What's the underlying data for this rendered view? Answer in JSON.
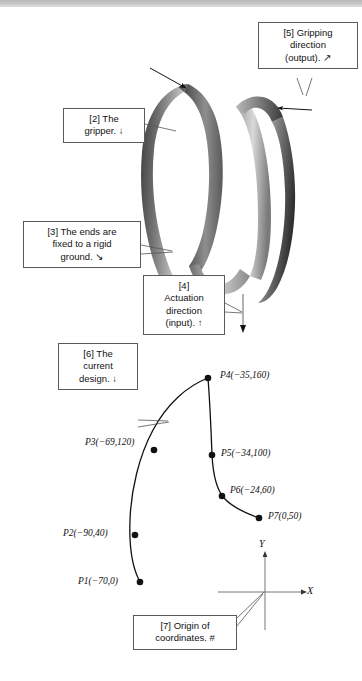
{
  "figure": {
    "topbar_color": "#c4c4c4",
    "background_color": "#ffffff",
    "ribbon_dark": "#3f3f3f",
    "ribbon_light": "#d8d8d8",
    "line_color": "#1a1a1a"
  },
  "callouts": [
    {
      "id": "5",
      "lines": [
        "[5] Gripping",
        "direction",
        "(output).  ↗"
      ],
      "arrow_glyph": "↗"
    },
    {
      "id": "2",
      "lines": [
        "[2] The",
        "gripper.  ↓"
      ],
      "arrow_glyph": "↓"
    },
    {
      "id": "3",
      "lines": [
        "[3] The ends are",
        "fixed to a rigid",
        "ground.  ↘"
      ],
      "arrow_glyph": "↘"
    },
    {
      "id": "4",
      "lines": [
        "[4]",
        "Actuation",
        "direction",
        "(input).  ↑"
      ],
      "arrow_glyph": "↑"
    },
    {
      "id": "6",
      "lines": [
        "[6] The",
        "current",
        "design.  ↓"
      ],
      "arrow_glyph": "↓"
    },
    {
      "id": "7",
      "lines": [
        "[7] Origin of",
        "coordinates.  #"
      ],
      "arrow_glyph": "#"
    }
  ],
  "design_curve": {
    "axes": {
      "x_label": "X",
      "y_label": "Y"
    },
    "points": [
      {
        "name": "P1",
        "label": "P1(−70,0)",
        "x": -70,
        "y": 0
      },
      {
        "name": "P2",
        "label": "P2(−90,40)",
        "x": -90,
        "y": 40
      },
      {
        "name": "P3",
        "label": "P3(−69,120)",
        "x": -69,
        "y": 120
      },
      {
        "name": "P4",
        "label": "P4(−35,160)",
        "x": -35,
        "y": 160
      },
      {
        "name": "P5",
        "label": "P5(−34,100)",
        "x": -34,
        "y": 100
      },
      {
        "name": "P6",
        "label": "P6(−24,60)",
        "x": -24,
        "y": 60
      },
      {
        "name": "P7",
        "label": "P7(0,50)",
        "x": 0,
        "y": 50
      }
    ]
  }
}
